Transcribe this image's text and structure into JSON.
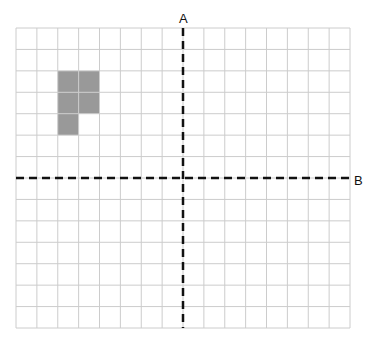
{
  "diagram": {
    "title": "",
    "grid": {
      "columns": 16,
      "rows": 14,
      "left": 16,
      "top": 28,
      "right": 350,
      "bottom": 328,
      "line_color": "#cccccc"
    },
    "axes": [
      {
        "name": "A",
        "orientation": "vertical",
        "after_column": 8,
        "label": "A",
        "style": "dashed",
        "color": "#111111"
      },
      {
        "name": "B",
        "orientation": "horizontal",
        "after_row": 7,
        "label": "B",
        "style": "dashed",
        "color": "#111111"
      }
    ],
    "shape": {
      "fill": "#999999",
      "cells": [
        {
          "col": 2,
          "row": 2
        },
        {
          "col": 3,
          "row": 2
        },
        {
          "col": 2,
          "row": 3
        },
        {
          "col": 3,
          "row": 3
        },
        {
          "col": 2,
          "row": 4
        }
      ]
    },
    "labels": {
      "axis_a": "A",
      "axis_b": "B"
    }
  }
}
